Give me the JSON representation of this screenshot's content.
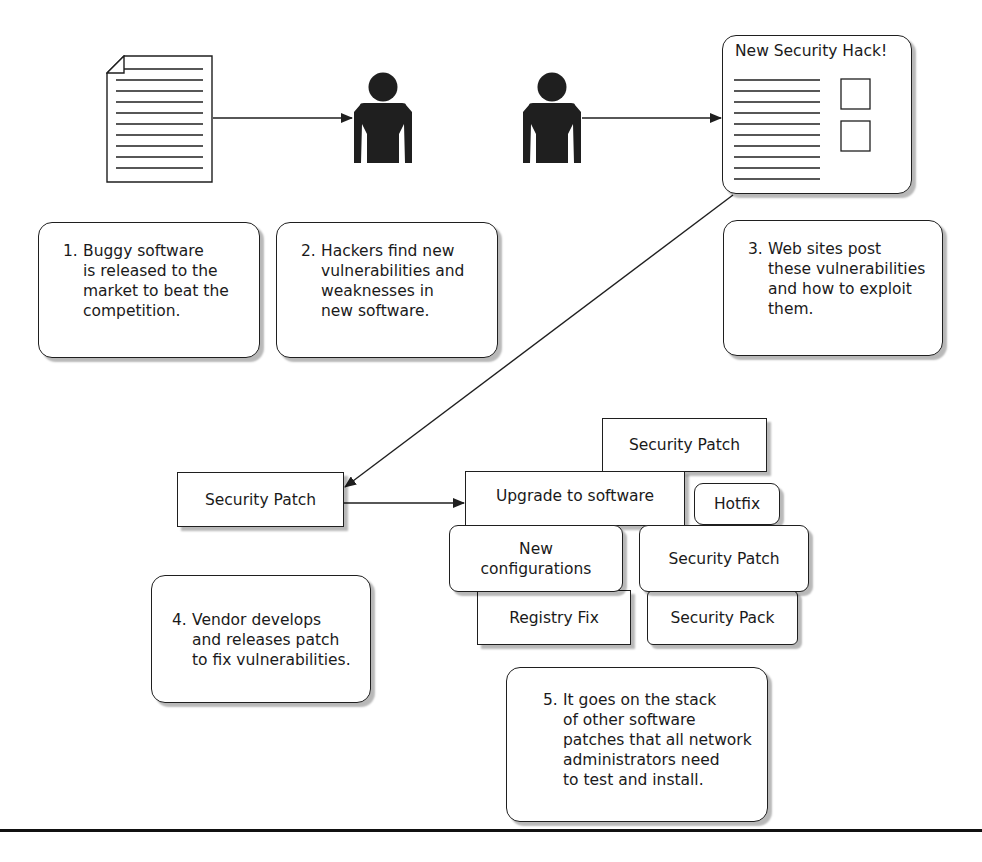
{
  "diagram": {
    "icons": {
      "document": "document-icon",
      "hacker_1": "person-icon",
      "hacker_2": "person-icon",
      "website": "web-page-icon"
    },
    "website_title": "New Security Hack!",
    "steps": [
      {
        "num": "1.",
        "lines": [
          "Buggy software",
          "is released to the",
          "market to beat the",
          "competition."
        ]
      },
      {
        "num": "2.",
        "lines": [
          "Hackers find new",
          "vulnerabilities and",
          "weaknesses in",
          "new software."
        ]
      },
      {
        "num": "3.",
        "lines": [
          "Web sites post",
          "these vulnerabilities",
          "and how to exploit",
          "them."
        ]
      },
      {
        "num": "4.",
        "lines": [
          "Vendor develops",
          "and releases patch",
          "to fix vulnerabilities."
        ]
      },
      {
        "num": "5.",
        "lines": [
          "It goes on the stack",
          "of other software",
          "patches that all network",
          "administrators need",
          "to test and install."
        ]
      }
    ],
    "vendor_patch": "Security Patch",
    "stack": {
      "upgrade": "Upgrade to software",
      "security_patch_top": "Security Patch",
      "hotfix": "Hotfix",
      "new_config": [
        "New",
        "configurations"
      ],
      "security_patch_mid": "Security Patch",
      "registry_fix": "Registry Fix",
      "security_pack": "Security Pack"
    },
    "colors": {
      "stroke": "#1f1f1f",
      "fill": "#ffffff",
      "shadow": "#9a9a9a"
    }
  }
}
